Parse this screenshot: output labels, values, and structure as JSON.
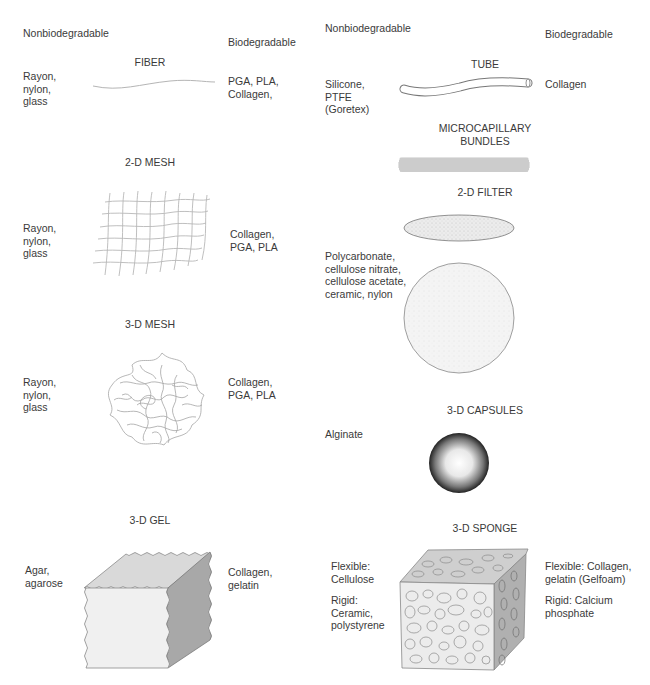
{
  "left_column": {
    "header_nonbiodegradable": "Nonbiodegradable",
    "header_biodegradable": "Biodegradable",
    "items": [
      {
        "title": "FIBER",
        "nonbiodegradable": "Rayon,\nnylon,\nglass",
        "biodegradable": "PGA, PLA,\nCollagen,",
        "icon": "fiber-icon"
      },
      {
        "title": "2-D MESH",
        "nonbiodegradable": "Rayon,\nnylon,\nglass",
        "biodegradable": "Collagen,\nPGA, PLA",
        "icon": "2d-mesh-icon"
      },
      {
        "title": "3-D MESH",
        "nonbiodegradable": "Rayon,\nnylon,\nglass",
        "biodegradable": "Collagen,\nPGA, PLA",
        "icon": "3d-mesh-icon"
      },
      {
        "title": "3-D GEL",
        "nonbiodegradable": "Agar,\nagarose",
        "biodegradable": "Collagen,\ngelatin",
        "icon": "gel-cube-icon"
      }
    ]
  },
  "right_column": {
    "header_nonbiodegradable": "Nonbiodegradable",
    "header_biodegradable": "Biodegradable",
    "items": [
      {
        "title": "TUBE",
        "nonbiodegradable": "Silicone,\nPTFE\n(Goretex)",
        "biodegradable": "Collagen",
        "icon": "tube-icon"
      },
      {
        "title": "MICROCAPILLARY\nBUNDLES",
        "nonbiodegradable": "",
        "biodegradable": "",
        "icon": "microcapillary-bundle-icon"
      },
      {
        "title": "2-D FILTER",
        "nonbiodegradable": "Polycarbonate,\ncellulose nitrate,\ncellulose acetate,\nceramic, nylon",
        "biodegradable": "",
        "icon": "filter-disc-icon"
      },
      {
        "title": "3-D CAPSULES",
        "nonbiodegradable": "Alginate",
        "biodegradable": "",
        "icon": "capsule-sphere-icon"
      },
      {
        "title": "3-D SPONGE",
        "nonbiodegradable": "Flexible:\nCellulose",
        "nonbiodegradable_2": "Rigid:\nCeramic,\npolystyrene",
        "biodegradable": "Flexible: Collagen,\ngelatin (Gelfoam)",
        "biodegradable_2": "Rigid: Calcium\nphosphate",
        "icon": "sponge-cube-icon"
      }
    ]
  },
  "colors": {
    "text": "#3a3a3a",
    "line": "#9a9a9a",
    "gel_top": "#d9d9d9",
    "gel_front": "#f0f0f0",
    "gel_side": "#a8a8a8",
    "sponge_front": "#ececec",
    "sponge_side": "#b0b0b0"
  }
}
